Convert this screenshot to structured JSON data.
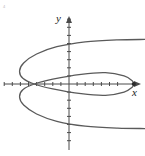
{
  "figure": {
    "kind": "math-graph",
    "title": "",
    "background_color": "#ffffff",
    "corner_mark": "4",
    "axis_color": "#4a4a4a",
    "curve_color": "#5a5a5a",
    "point_color": "#2b2b2b",
    "labels": {
      "x_axis": "x",
      "y_axis": "y"
    }
  },
  "chart_data": {
    "type": "line",
    "title": "",
    "xlabel": "x",
    "ylabel": "y",
    "grid": false,
    "legend": null,
    "axes": {
      "origin_px": [
        69,
        84
      ],
      "unit_px": 8.1,
      "x_axis_y_px": 84,
      "y_axis_x_px": 69,
      "xlim": [
        -8.5,
        9.5
      ],
      "ylim": [
        -9.0,
        9.2
      ],
      "x_tick_count_left": 8,
      "x_tick_count_right": 6,
      "y_tick_count_up": 8,
      "y_tick_count_down": 7,
      "tick_length_px": 4,
      "x_arrow": "right",
      "y_arrow": "up"
    },
    "annotations": [
      {
        "name": "vertex-point",
        "x": 8.0,
        "y": 0.0,
        "marker": "filled-dot",
        "radius_px": 2.1
      }
    ],
    "series": [
      {
        "name": "sideways-curve",
        "description": "Left-opening curve crossing x-axis at right vertex; upper and lower branches sweep back to the right edge",
        "stroke_width_px": 1.3,
        "path_points": [
          [
            9.4,
            5.5
          ],
          [
            6.0,
            5.45
          ],
          [
            2.0,
            5.2
          ],
          [
            -1.5,
            4.6
          ],
          [
            -4.0,
            3.7
          ],
          [
            -5.6,
            2.6
          ],
          [
            -6.1,
            1.6
          ],
          [
            -5.7,
            0.7
          ],
          [
            -4.3,
            0.0
          ],
          [
            -2.0,
            -0.6
          ],
          [
            1.5,
            -1.2
          ],
          [
            4.5,
            -1.4
          ],
          [
            6.8,
            -1.0
          ],
          [
            7.8,
            -0.4
          ],
          [
            8.0,
            0.0
          ],
          [
            7.8,
            0.4
          ],
          [
            6.8,
            1.0
          ],
          [
            4.5,
            1.4
          ],
          [
            1.5,
            1.2
          ],
          [
            -2.0,
            0.6
          ],
          [
            -4.3,
            0.0
          ],
          [
            -5.7,
            -0.7
          ],
          [
            -6.1,
            -1.6
          ],
          [
            -5.6,
            -2.6
          ],
          [
            -4.0,
            -3.7
          ],
          [
            -1.5,
            -4.6
          ],
          [
            2.0,
            -5.2
          ],
          [
            6.0,
            -5.45
          ],
          [
            9.4,
            -5.5
          ]
        ]
      }
    ]
  }
}
